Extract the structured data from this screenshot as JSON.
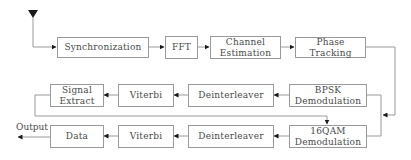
{
  "diagram": {
    "type": "block-diagram",
    "title": "",
    "input_marker": "input-arrow",
    "output_label": "Output",
    "blocks": {
      "synchronization": "Synchronization",
      "fft": "FFT",
      "channel_estimation": "Channel\nEstimation",
      "phase_tracking": "Phase\nTracking",
      "bpsk_demod": "BPSK\nDemodulation",
      "deinterleaver_1": "Deinterleaver",
      "viterbi_1": "Viterbi",
      "signal_extract": "Signal\nExtract",
      "qam16_demod": "16QAM\nDemodulation",
      "deinterleaver_2": "Deinterleaver",
      "viterbi_2": "Viterbi",
      "data": "Data"
    },
    "edges": [
      {
        "from": "input",
        "to": "Synchronization"
      },
      {
        "from": "Synchronization",
        "to": "FFT"
      },
      {
        "from": "FFT",
        "to": "Channel Estimation"
      },
      {
        "from": "Channel Estimation",
        "to": "Phase Tracking"
      },
      {
        "from": "Phase Tracking",
        "to": "BPSK Demodulation / 16QAM Demodulation"
      },
      {
        "from": "BPSK Demodulation",
        "to": "Deinterleaver"
      },
      {
        "from": "Deinterleaver",
        "to": "Viterbi"
      },
      {
        "from": "Viterbi",
        "to": "Signal Extract"
      },
      {
        "from": "Signal Extract",
        "to": "16QAM Demodulation"
      },
      {
        "from": "16QAM Demodulation",
        "to": "Deinterleaver"
      },
      {
        "from": "Deinterleaver",
        "to": "Viterbi"
      },
      {
        "from": "Viterbi",
        "to": "Data"
      },
      {
        "from": "Data",
        "to": "Output"
      }
    ],
    "colors": {
      "box_border": "#9a9a9a",
      "line": "#9a9a9a",
      "arrowhead": "#1a1a1a",
      "text": "#4a4a4a"
    }
  }
}
